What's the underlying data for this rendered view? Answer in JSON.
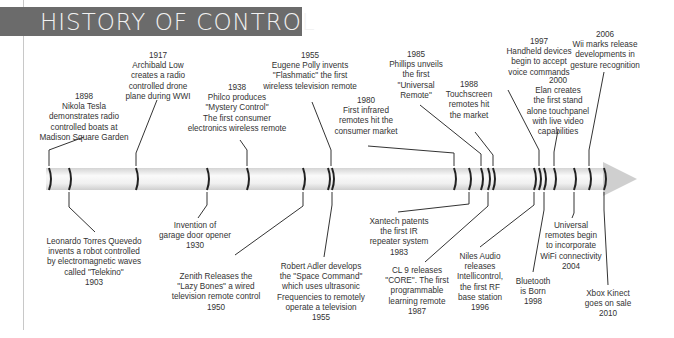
{
  "title": "HISTORY OF CONTROL",
  "colors": {
    "banner": "#6b6b6b",
    "banner_text": "#f2f2f2",
    "bar": "#e6e6e6",
    "marker": "#222222",
    "text": "#333333"
  },
  "events_above": [
    {
      "year": "1898",
      "lines": [
        "Nikola Tesla",
        "demonstrates radio",
        "controlled boats at",
        "Madison Square Garden"
      ],
      "x": 84,
      "y": 92
    },
    {
      "year": "1917",
      "lines": [
        "Archibald Low",
        "creates a radio",
        "controlled drone",
        "plane during WWI"
      ],
      "x": 158,
      "y": 51
    },
    {
      "year": "1938",
      "lines": [
        "Philco produces",
        "\"Mystery Control\"",
        "The first consumer",
        "electronics wireless remote"
      ],
      "x": 237,
      "y": 83
    },
    {
      "year": "1955",
      "lines": [
        "Eugene Polly invents",
        "\"Flashmatic\" the first",
        "wireless television remote"
      ],
      "x": 310,
      "y": 51
    },
    {
      "year": "1980",
      "lines": [
        "First infrared",
        "remotes hit the",
        "consumer market"
      ],
      "x": 366,
      "y": 96
    },
    {
      "year": "1985",
      "lines": [
        "Phillips unveils",
        "the first",
        "\"Universal",
        "Remote\""
      ],
      "x": 416,
      "y": 50
    },
    {
      "year": "1988",
      "lines": [
        "Touchscreen",
        "remotes hit",
        "the market"
      ],
      "x": 469,
      "y": 80
    },
    {
      "year": "1997",
      "lines": [
        "Handheld devices",
        "begin to accept",
        "voice commands"
      ],
      "x": 539,
      "y": 37
    },
    {
      "year": "2000",
      "lines": [
        "Elan creates",
        "the first stand",
        "alone touchpanel",
        "with live video",
        "capabilities"
      ],
      "x": 558,
      "y": 76
    },
    {
      "year": "2006",
      "lines": [
        "Wii marks release",
        "developments in",
        "gesture recognition"
      ],
      "x": 605,
      "y": 30
    }
  ],
  "events_below": [
    {
      "year": "1903",
      "lines": [
        "Leonardo Torres Quevedo",
        "invents a robot controlled",
        "by electromagnetic waves",
        "called \"Telekino\""
      ],
      "x": 94,
      "y": 237
    },
    {
      "year": "1930",
      "lines": [
        "Invention of",
        "garage door opener"
      ],
      "x": 195,
      "y": 221
    },
    {
      "year": "1950",
      "lines": [
        "Zenith Releases the",
        "\"Lazy Bones\" a wired",
        "television remote control"
      ],
      "x": 216,
      "y": 272
    },
    {
      "year": "1955",
      "lines": [
        "Robert Adler develops",
        "the \"Space Command\"",
        "which uses ultrasonic",
        "Frequencies to remotely",
        "operate a television"
      ],
      "x": 321,
      "y": 262
    },
    {
      "year": "1983",
      "lines": [
        "Xantech patents",
        "the first IR",
        "repeater system"
      ],
      "x": 399,
      "y": 217
    },
    {
      "year": "1987",
      "lines": [
        "CL 9 releases",
        "\"CORE\". The first",
        "programmable",
        "learning remote"
      ],
      "x": 417,
      "y": 266
    },
    {
      "year": "1996",
      "lines": [
        "Niles Audio",
        "releases",
        "Intellicontrol,",
        "the first RF",
        "base station"
      ],
      "x": 480,
      "y": 252
    },
    {
      "year": "1998",
      "lines": [
        "Bluetooth",
        "is Born"
      ],
      "x": 533,
      "y": 277
    },
    {
      "year": "2004",
      "lines": [
        "Universal",
        "remotes begin",
        "to incorporate",
        "WiFi connectivity"
      ],
      "x": 571,
      "y": 221
    },
    {
      "year": "2010",
      "lines": [
        "Xbox Kinect",
        "goes on sale"
      ],
      "x": 608,
      "y": 289
    }
  ]
}
